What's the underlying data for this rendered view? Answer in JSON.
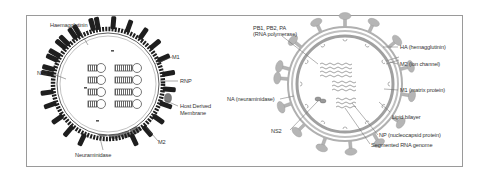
{
  "figure": {
    "left_diagram": {
      "name": "Influenza virion (schematic)",
      "labels": {
        "haemagglutinin": "Haemagglutinin",
        "m1": "M1",
        "ns2": "NS2",
        "rnp": "RNP",
        "host_membrane_line1": "Host Derived",
        "host_membrane_line2": "Membrane",
        "m2": "M2",
        "neuraminidase": "Neuraminidase"
      }
    },
    "right_diagram": {
      "name": "Influenza virion (cross-section)",
      "labels": {
        "polymerase_line1": "PB1, PB2, PA",
        "polymerase_line2": "(RNA polymerase)",
        "ha": "HA (hemagglutinin)",
        "m2": "M2 (ion channel)",
        "m1": "M1 (matrix protein)",
        "na": "NA (neuraminidase)",
        "lipid": "Lipid bilayer",
        "ns2": "NS2",
        "np": "NP (nucleocapsid protein)",
        "genome": "Segmented RNA genome"
      }
    },
    "colors": {
      "frame": "#9a9a9a",
      "spike_dark": "#222222",
      "na_gray": "#7a7a7a",
      "right_virion": "#a8a8a8",
      "label_text": "#333333"
    }
  }
}
